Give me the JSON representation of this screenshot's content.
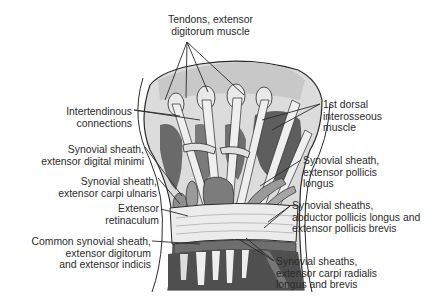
{
  "figure": {
    "colors": {
      "background": "#ffffff",
      "outline": "#2a2a2a",
      "muscle_dark": "#5e5e5e",
      "muscle_mid": "#8a8a8a",
      "tendon_light": "#e6e6e6",
      "sheath": "#9a9a9a",
      "retinaculum": "#ececec",
      "leader_line": "#2a2a2a",
      "label_text": "#2b2b2b"
    }
  },
  "labels": {
    "tendons_extensor_digitorum": {
      "lines": [
        "Tendons, extensor",
        "digitorum muscle"
      ]
    },
    "intertendinous_connections": {
      "lines": [
        "Intertendinous",
        "connections"
      ]
    },
    "synovial_sheath_edm": {
      "lines": [
        "Synovial sheath,",
        "extensor digital minimi"
      ]
    },
    "synovial_sheath_ecu": {
      "lines": [
        "Synovial sheath,",
        "extensor carpi ulnaris"
      ]
    },
    "extensor_retinaculum": {
      "lines": [
        "Extensor",
        "retinaculum"
      ]
    },
    "common_synovial_sheath": {
      "lines": [
        "Common synovial sheath,",
        "extensor digitorum",
        "and extensor indicis"
      ]
    },
    "first_dorsal_interosseous": {
      "lines": [
        "1st dorsal",
        "interosseous",
        "muscle"
      ]
    },
    "synovial_sheath_epl": {
      "lines": [
        "Synovial sheath,",
        "extensor pollicis",
        "longus"
      ]
    },
    "synovial_sheaths_apl_epb": {
      "lines": [
        "Synovial sheaths,",
        "abductor pollicis longus and",
        "extensor pollicis brevis"
      ]
    },
    "synovial_sheaths_ecrl_ecrb": {
      "lines": [
        "Synovial sheaths,",
        "extensor carpi radialis",
        "longus and brevis"
      ]
    }
  }
}
